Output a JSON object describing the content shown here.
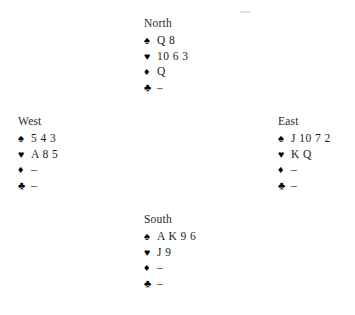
{
  "diagram": {
    "type": "bridge-hand-diagram",
    "suit_order": [
      "spades",
      "hearts",
      "diamonds",
      "clubs"
    ],
    "suit_symbols": {
      "spades": "♠",
      "hearts": "♥",
      "diamonds": "♦",
      "clubs": "♣"
    },
    "void_marker": "–",
    "colors": {
      "background": "#ffffff",
      "text": "#1c1c1c",
      "suit_symbol": "#000000",
      "label": "#2a2a2a"
    },
    "hands": {
      "north": {
        "label": "North",
        "spades": "Q 8",
        "hearts": "10 6 3",
        "diamonds": "Q",
        "clubs": "–"
      },
      "west": {
        "label": "West",
        "spades": "5 4 3",
        "hearts": "A 8 5",
        "diamonds": "–",
        "clubs": "–"
      },
      "east": {
        "label": "East",
        "spades": "J 10 7 2",
        "hearts": "K Q",
        "diamonds": "–",
        "clubs": "–"
      },
      "south": {
        "label": "South",
        "spades": "A K 9 6",
        "hearts": "J 9",
        "diamonds": "–",
        "clubs": "–"
      }
    }
  }
}
